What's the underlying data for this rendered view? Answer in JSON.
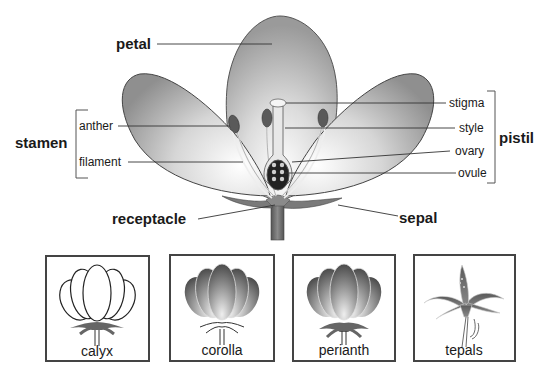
{
  "main_labels": {
    "petal": "petal",
    "stamen": "stamen",
    "anther": "anther",
    "filament": "filament",
    "receptacle": "receptacle",
    "sepal": "sepal",
    "pistil": "pistil",
    "stigma": "stigma",
    "style": "style",
    "ovary": "ovary",
    "ovule": "ovule"
  },
  "groups": [
    {
      "name": "stamen",
      "parts": [
        "anther",
        "filament"
      ]
    },
    {
      "name": "pistil",
      "parts": [
        "stigma",
        "style",
        "ovary",
        "ovule"
      ]
    }
  ],
  "panels": [
    {
      "label": "calyx",
      "icon": "calyx-flower-icon"
    },
    {
      "label": "corolla",
      "icon": "corolla-flower-icon"
    },
    {
      "label": "perianth",
      "icon": "perianth-flower-icon"
    },
    {
      "label": "tepals",
      "icon": "lily-tepals-icon"
    }
  ],
  "colors": {
    "petal_light": "#f2f2f2",
    "petal_dark": "#8a8a8a",
    "stem": "#6e6e6e",
    "anther": "#555555",
    "text": "#1a1a1a"
  }
}
